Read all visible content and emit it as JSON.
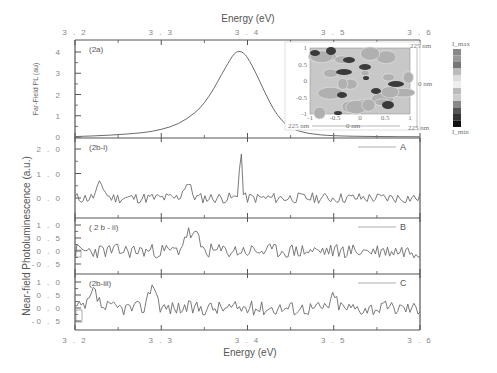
{
  "chart_data": {
    "type": "line",
    "title": "",
    "x_axis": {
      "label": "Energy (eV)",
      "range": [
        3.2,
        3.6
      ],
      "ticks": [
        3.2,
        3.3,
        3.4,
        3.5,
        3.6
      ],
      "tick_labels": [
        "3 . 2",
        "3 . 3",
        "3 . 4",
        "3 . 5",
        "3 . 6"
      ],
      "shown_top_and_bottom": true
    },
    "shared_ylabel": "Near-field Photoluminescence (a.u.)",
    "panels": [
      {
        "id": "2a",
        "label": "(2a)",
        "ylabel": "Far-Field PL (au)",
        "ylim": [
          0,
          4.4
        ],
        "yticks": [
          0,
          1,
          2,
          3,
          4
        ],
        "ytick_labels": [
          "0",
          "1",
          "2",
          "3",
          "4"
        ],
        "series": [
          {
            "name": "far-field PL",
            "x": [
              3.2,
              3.24,
              3.28,
              3.3,
              3.32,
              3.34,
              3.35,
              3.36,
              3.37,
              3.38,
              3.385,
              3.39,
              3.395,
              3.4,
              3.41,
              3.42,
              3.43,
              3.44,
              3.45,
              3.47,
              3.5,
              3.55,
              3.6
            ],
            "y": [
              0.02,
              0.08,
              0.2,
              0.35,
              0.6,
              1.15,
              1.6,
              2.2,
              2.95,
              3.65,
              3.95,
              4.05,
              3.98,
              3.75,
              3.0,
              2.1,
              1.3,
              0.75,
              0.4,
              0.15,
              0.05,
              0.02,
              0.01
            ]
          }
        ],
        "peak": {
          "x": 3.39,
          "y": 4.05
        }
      },
      {
        "id": "2b-i",
        "label": "(2b-i)",
        "legend": "A",
        "ylim": [
          -0.35,
          2.3
        ],
        "yticks": [
          0.0,
          1.0,
          2.0
        ],
        "ytick_labels": [
          "0 . 0",
          "1 . 0",
          "2 . 0"
        ],
        "series": [
          {
            "name": "A",
            "noise_seed": 11,
            "noise_amp": 0.22,
            "baseline": 0.0,
            "features": [
              {
                "x": 3.23,
                "y": 0.55
              },
              {
                "x": 3.33,
                "y": 0.6
              },
              {
                "x": 3.392,
                "y": 2.2,
                "width": 0.002
              }
            ]
          }
        ]
      },
      {
        "id": "2b-ii",
        "label": "( 2 b - ii)",
        "legend": "B",
        "ylim": [
          -0.75,
          1.2
        ],
        "yticks": [
          -0.5,
          0.0,
          0.5,
          1.0
        ],
        "ytick_labels": [
          "-0 . 5",
          "0 . 0",
          "0 . 5",
          "1 . 0"
        ],
        "series": [
          {
            "name": "B",
            "noise_seed": 23,
            "noise_amp": 0.28,
            "baseline": 0.0,
            "features": [
              {
                "x": 3.33,
                "y": 0.65
              },
              {
                "x": 3.34,
                "y": 0.55
              }
            ]
          }
        ]
      },
      {
        "id": "2b-iii",
        "label": "(2b-iii)",
        "legend": "C",
        "ylim": [
          -0.75,
          1.2
        ],
        "yticks": [
          -0.5,
          0.0,
          0.5,
          1.0
        ],
        "ytick_labels": [
          "-0 . 5",
          "0 . 0",
          "0 . 5",
          "1 . 0"
        ],
        "series": [
          {
            "name": "C",
            "noise_seed": 37,
            "noise_amp": 0.28,
            "baseline": 0.0,
            "features": [
              {
                "x": 3.222,
                "y": 0.6
              },
              {
                "x": 3.29,
                "y": 0.95
              },
              {
                "x": 3.5,
                "y": 0.4
              }
            ]
          }
        ]
      }
    ],
    "inset": {
      "type": "heatmap",
      "description": "near-field intensity map",
      "x_labels": [
        "225 nm",
        "0 nm",
        "225 nm"
      ],
      "y_labels": [
        "225 nm",
        "0 nm"
      ],
      "inner_xticks": [
        "-1",
        "-0.5",
        "0",
        "0.5",
        "1"
      ],
      "inner_yticks": [
        "1",
        "0.5",
        "0",
        "-0.5",
        "-1"
      ],
      "colorbar": {
        "top": "I_max",
        "bottom": "I_min"
      }
    },
    "grid": false,
    "legend_position": "upper right of each 2b panel"
  },
  "text": {
    "top_xlabel": "Energy (eV)",
    "bottom_xlabel": "Energy (eV)",
    "ylabel_2a": "Far-Field PL (au)",
    "ylabel_shared": "Near-field Photoluminescence (a.u.)"
  },
  "colors": {
    "line": "#6b6b6b",
    "axis": "#555555",
    "text": "#777777"
  }
}
